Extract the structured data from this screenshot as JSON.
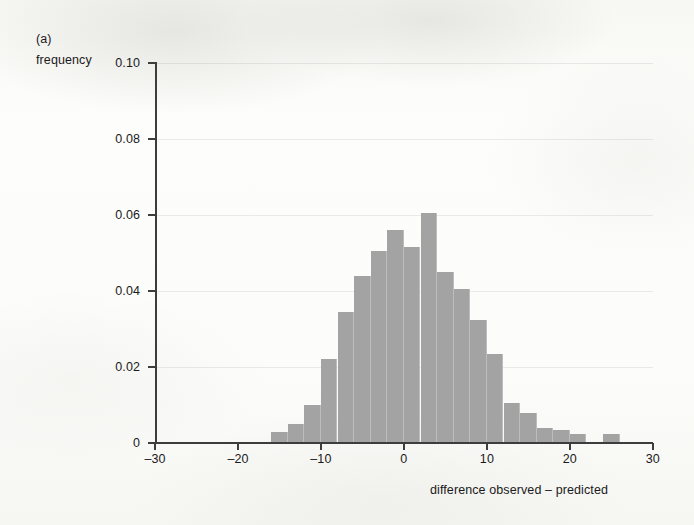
{
  "figure": {
    "panel_label": "(a)",
    "y_axis_title": "frequency",
    "x_axis_title": "difference observed – predicted",
    "bar_color": "#a3a3a3",
    "axis_color": "#3d3d3d"
  },
  "chart_data": {
    "type": "bar",
    "title": "",
    "subtitle": "",
    "xlabel": "difference observed – predicted",
    "ylabel": "frequency",
    "xlim": [
      -32,
      32
    ],
    "ylim": [
      0,
      0.1
    ],
    "grid": true,
    "legend": null,
    "bin_width": 2,
    "x_ticks": [
      -30,
      -20,
      -10,
      0,
      10,
      20,
      30
    ],
    "x_tick_labels": [
      "–30",
      "–20",
      "–10",
      "0",
      "10",
      "20",
      "30"
    ],
    "y_ticks": [
      0,
      0.02,
      0.04,
      0.06,
      0.08,
      0.1
    ],
    "y_tick_labels": [
      "0",
      "0.02",
      "0.04",
      "0.06",
      "0.08",
      "0.10"
    ],
    "bin_left_edges": [
      -16,
      -14,
      -12,
      -10,
      -8,
      -6,
      -4,
      -2,
      0,
      2,
      4,
      6,
      8,
      10,
      12,
      14,
      16,
      18,
      20,
      22,
      24
    ],
    "categories": [
      "-16",
      "-14",
      "-12",
      "-10",
      "-8",
      "-6",
      "-4",
      "-2",
      "0",
      "2",
      "4",
      "6",
      "8",
      "10",
      "12",
      "14",
      "16",
      "18",
      "20",
      "22",
      "24"
    ],
    "values": [
      0.003,
      0.005,
      0.01,
      0.022,
      0.0345,
      0.044,
      0.0505,
      0.056,
      0.0515,
      0.0605,
      0.045,
      0.0405,
      0.0325,
      0.0235,
      0.0105,
      0.008,
      0.004,
      0.0035,
      0.0025,
      0.0,
      0.0025
    ]
  }
}
